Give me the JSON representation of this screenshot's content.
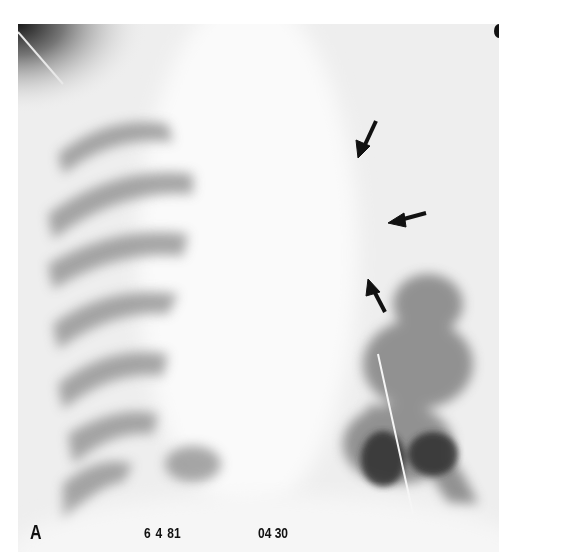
{
  "figure": {
    "panel_label": "A",
    "date_stamp": "6 4 81",
    "time_stamp": "04 30",
    "arrows": [
      {
        "id": "arrow-1",
        "direction": "down-left"
      },
      {
        "id": "arrow-2",
        "direction": "left"
      },
      {
        "id": "arrow-3",
        "direction": "up-left"
      }
    ],
    "colors": {
      "background": "#ffffff",
      "film_base": "#efefef",
      "lung_shadow": "#6e6e6e",
      "arrow": "#111111"
    }
  }
}
